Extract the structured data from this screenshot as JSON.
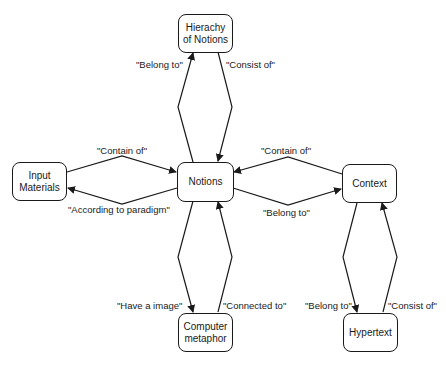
{
  "nodes": {
    "hierachy": {
      "label": "Hierachy of Notions"
    },
    "input": {
      "label": "Input Materials"
    },
    "notions": {
      "label": "Notions"
    },
    "context": {
      "label": "Context"
    },
    "computer": {
      "label": "Computer metaphor"
    },
    "hypertext": {
      "label": "Hypertext"
    }
  },
  "edges": {
    "notions_to_hierachy": {
      "label": "\"Belong to\""
    },
    "hierachy_to_notions": {
      "label": "\"Consist of\""
    },
    "input_to_notions": {
      "label": "\"Contain of\""
    },
    "notions_to_input": {
      "label": "\"According to paradigm\""
    },
    "context_to_notions": {
      "label": "\"Contain of\""
    },
    "notions_to_context": {
      "label": "\"Belong to\""
    },
    "notions_to_computer": {
      "label": "\"Have a image\""
    },
    "computer_to_notions": {
      "label": "\"Connected to\""
    },
    "context_to_hypertext": {
      "label": "\"Belong to\""
    },
    "hypertext_to_context": {
      "label": "\"Consist of\""
    }
  },
  "colors": {
    "stroke": "#1a1a1a",
    "background": "#ffffff"
  }
}
